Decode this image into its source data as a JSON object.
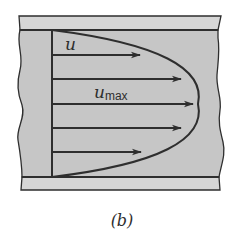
{
  "figure": {
    "caption": "(b)",
    "colors": {
      "fluid_fill": "#c6c6c6",
      "wall_fill": "#d6d6d6",
      "line": "#2e2e2e",
      "background": "#ffffff"
    },
    "labels": {
      "velocity": "u",
      "max_velocity_main": "u",
      "max_velocity_sub": "max"
    },
    "arrows": [
      {
        "y": 55,
        "x_start": 52,
        "x_end": 140
      },
      {
        "y": 79,
        "x_start": 52,
        "x_end": 181
      },
      {
        "y": 104,
        "x_start": 52,
        "x_end": 193
      },
      {
        "y": 128,
        "x_start": 52,
        "x_end": 181
      },
      {
        "y": 152,
        "x_start": 52,
        "x_end": 141
      }
    ]
  }
}
